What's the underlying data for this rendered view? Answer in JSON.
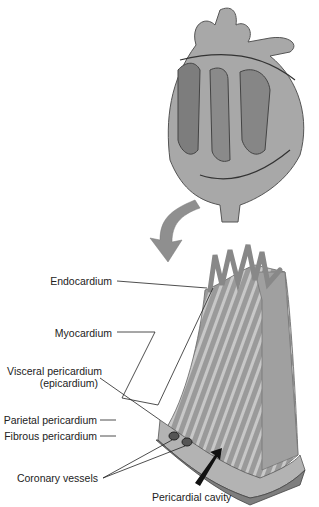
{
  "diagram": {
    "labels": {
      "endocardium": "Endocardium",
      "myocardium": "Myocardium",
      "visceral_1": "Visceral pericardium",
      "visceral_2": "(epicardium)",
      "parietal": "Parietal pericardium",
      "fibrous": "Fibrous pericardium",
      "coronary": "Coronary vessels",
      "cavity": "Pericardial cavity"
    }
  }
}
